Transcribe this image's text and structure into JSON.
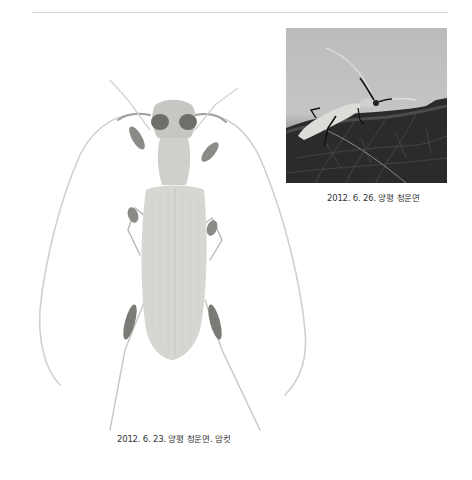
{
  "page": {
    "background": "#ffffff",
    "top_rule_color": "#d4d4d4"
  },
  "figures": [
    {
      "id": "field-photo",
      "description": "longhorn beetle resting on a leaf, side view, gray sky background",
      "caption": "2012. 6. 26. 양평 청운면"
    },
    {
      "id": "specimen-photo",
      "description": "pinned longhorn beetle specimen, dorsal view, long antennae",
      "caption": "2012. 6. 23. 양평 청운면. 암컷"
    }
  ]
}
